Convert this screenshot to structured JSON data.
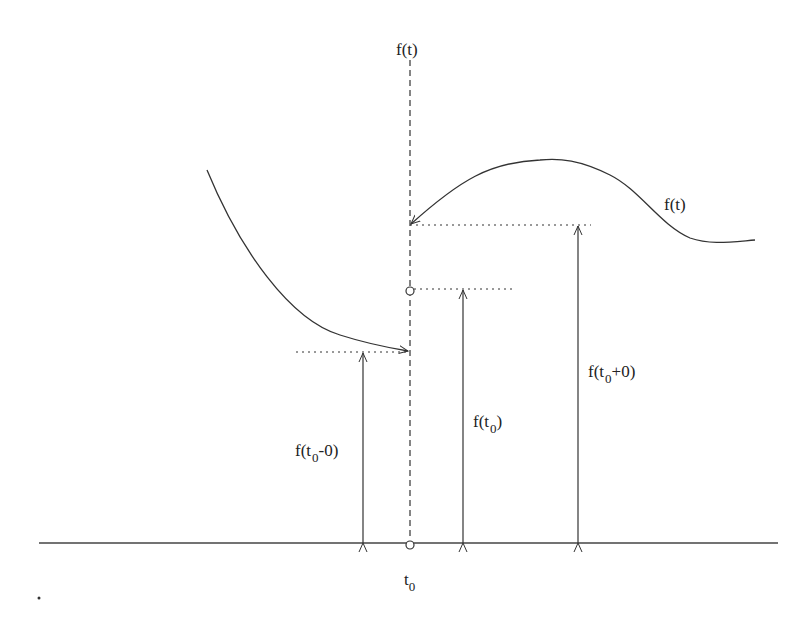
{
  "diagram": {
    "labels": {
      "axis_top": "f(t)",
      "curve": "f(t)",
      "t0_base": "t",
      "t0_sub": "0",
      "left_limit_pre": "f(t",
      "left_limit_sub": "0",
      "left_limit_post": "-0)",
      "value_pre": "f(t",
      "value_sub": "0",
      "value_post": ")",
      "right_limit_pre": "f(t",
      "right_limit_sub": "0",
      "right_limit_post": "+0)"
    },
    "colors": {
      "stroke": "#333333",
      "background": "#ffffff"
    }
  }
}
